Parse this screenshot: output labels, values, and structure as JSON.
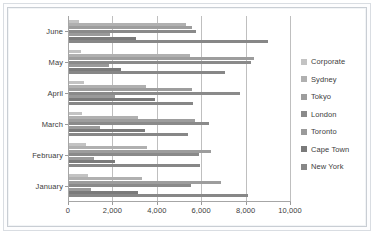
{
  "chart_data": {
    "type": "bar",
    "orientation": "horizontal",
    "title": "",
    "xlabel": "",
    "ylabel": "",
    "categories": [
      "January",
      "February",
      "March",
      "April",
      "May",
      "June"
    ],
    "category_order_top_to_bottom": [
      "June",
      "May",
      "April",
      "March",
      "February",
      "January"
    ],
    "xlim": [
      0,
      10000
    ],
    "xticks": [
      0,
      2000,
      4000,
      6000,
      8000,
      10000
    ],
    "xtick_labels": [
      "0",
      "2,000",
      "4,000",
      "6,000",
      "8,000",
      "10,000"
    ],
    "grid": true,
    "grid_axis": "x",
    "legend_position": "right",
    "series": [
      {
        "name": "Corporate",
        "color": "#c3c3c3",
        "values": [
          900,
          800,
          650,
          700,
          600,
          500
        ]
      },
      {
        "name": "Sydney",
        "color": "#b0b0b0",
        "values": [
          3350,
          3550,
          3150,
          3500,
          5500,
          5300
        ]
      },
      {
        "name": "Tokyo",
        "color": "#9d9d9d",
        "values": [
          6900,
          6450,
          5700,
          5600,
          8400,
          5600
        ]
      },
      {
        "name": "London",
        "color": "#8a8a8a",
        "values": [
          5550,
          5900,
          6350,
          7750,
          8250,
          5750
        ]
      },
      {
        "name": "Toronto",
        "color": "#9a9a9a",
        "values": [
          1050,
          1150,
          1450,
          2100,
          1850,
          1900
        ]
      },
      {
        "name": "Cape Town",
        "color": "#7a7a7a",
        "values": [
          3150,
          2100,
          3450,
          3900,
          2400,
          3050
        ]
      },
      {
        "name": "New York",
        "color": "#878787",
        "values": [
          8100,
          5950,
          5400,
          5650,
          7050,
          9000
        ]
      }
    ]
  },
  "legend": {
    "items": [
      {
        "label": "Corporate"
      },
      {
        "label": "Sydney"
      },
      {
        "label": "Tokyo"
      },
      {
        "label": "London"
      },
      {
        "label": "Toronto"
      },
      {
        "label": "Cape Town"
      },
      {
        "label": "New York"
      }
    ]
  }
}
